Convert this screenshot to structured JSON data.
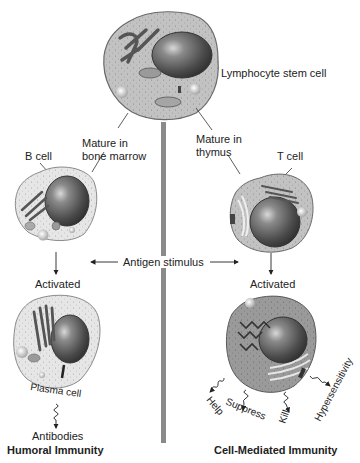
{
  "labels": {
    "stem_cell": "Lymphocyte stem cell",
    "mature_bone_marrow_1": "Mature in",
    "mature_bone_marrow_2": "bone marrow",
    "mature_thymus_1": "Mature in",
    "mature_thymus_2": "thymus",
    "b_cell": "B cell",
    "t_cell": "T cell",
    "antigen_stimulus": "Antigen stimulus",
    "activated_left": "Activated",
    "activated_right": "Activated",
    "plasma_cell": "Plasma cell",
    "antibodies": "Antibodies",
    "humoral_immunity": "Humoral Immunity",
    "cell_mediated_immunity": "Cell-Mediated Immunity",
    "functions": {
      "help": "Help",
      "suppress": "Suppress",
      "kill": "Kill",
      "hypersensitivity": "Hypersensitivity"
    }
  },
  "colors": {
    "divider": "#8a8a8a",
    "cell_light": "#e4e4e4",
    "cell_medium": "#b8b8b8",
    "cell_dark": "#8e8e8e",
    "nucleus": "#5a5a5a",
    "nucleus_dark": "#2e2e2e",
    "organelle": "#6e6e6e"
  }
}
